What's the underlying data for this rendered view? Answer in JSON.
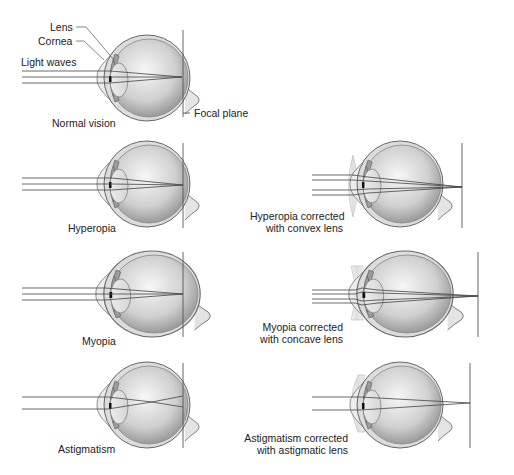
{
  "figure": {
    "panels": [
      {
        "id": "normal",
        "label": "Normal vision",
        "annotations": {
          "lens": "Lens",
          "cornea": "Cornea",
          "light_waves": "Light waves",
          "focal_plane": "Focal plane"
        }
      },
      {
        "id": "hyperopia",
        "label": "Hyperopia"
      },
      {
        "id": "hyperopia_corrected",
        "label_line1": "Hyperopia corrected",
        "label_line2": "with convex lens"
      },
      {
        "id": "myopia",
        "label": "Myopia"
      },
      {
        "id": "myopia_corrected",
        "label_line1": "Myopia corrected",
        "label_line2": "with concave lens"
      },
      {
        "id": "astigmatism",
        "label": "Astigmatism"
      },
      {
        "id": "astigmatism_corrected",
        "label_line1": "Astigmatism corrected",
        "label_line2": "with astigmatic lens"
      }
    ]
  },
  "colors": {
    "eye_fill_light": "#f2f2f2",
    "eye_fill_dark": "#9a9a9a",
    "outline": "#555555",
    "ray": "#444444",
    "lens_fill": "#e8e8e8"
  }
}
